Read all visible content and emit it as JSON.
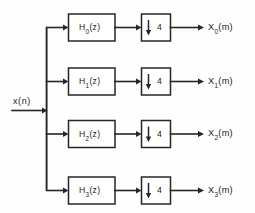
{
  "diagram": {
    "type": "block-diagram",
    "stroke_color": "#262626",
    "background_color": "#fefefe",
    "input": {
      "label_main": "x",
      "label_paren": "(n)",
      "label_full": "x(n)"
    },
    "branches": [
      {
        "filter_h": "H",
        "filter_sub": "0",
        "filter_arg": "(z)",
        "filter_full": "H0(z)",
        "decimator_arrow": "↓",
        "decimator_factor": "4",
        "output_x": "X",
        "output_sub": "0",
        "output_arg": "(m)",
        "output_full": "X0(m)"
      },
      {
        "filter_h": "H",
        "filter_sub": "1",
        "filter_arg": "(z)",
        "filter_full": "H1(z)",
        "decimator_arrow": "↓",
        "decimator_factor": "4",
        "output_x": "X",
        "output_sub": "1",
        "output_arg": "(m)",
        "output_full": "X1(m)"
      },
      {
        "filter_h": "H",
        "filter_sub": "2",
        "filter_arg": "(z)",
        "filter_full": "H2(z)",
        "decimator_arrow": "↓",
        "decimator_factor": "4",
        "output_x": "X",
        "output_sub": "2",
        "output_arg": "(m)",
        "output_full": "X2(m)"
      },
      {
        "filter_h": "H",
        "filter_sub": "3",
        "filter_arg": "(z)",
        "filter_full": "H3(z)",
        "decimator_arrow": "↓",
        "decimator_factor": "4",
        "output_x": "X",
        "output_sub": "3",
        "output_arg": "(m)",
        "output_full": "X3(m)"
      }
    ]
  }
}
